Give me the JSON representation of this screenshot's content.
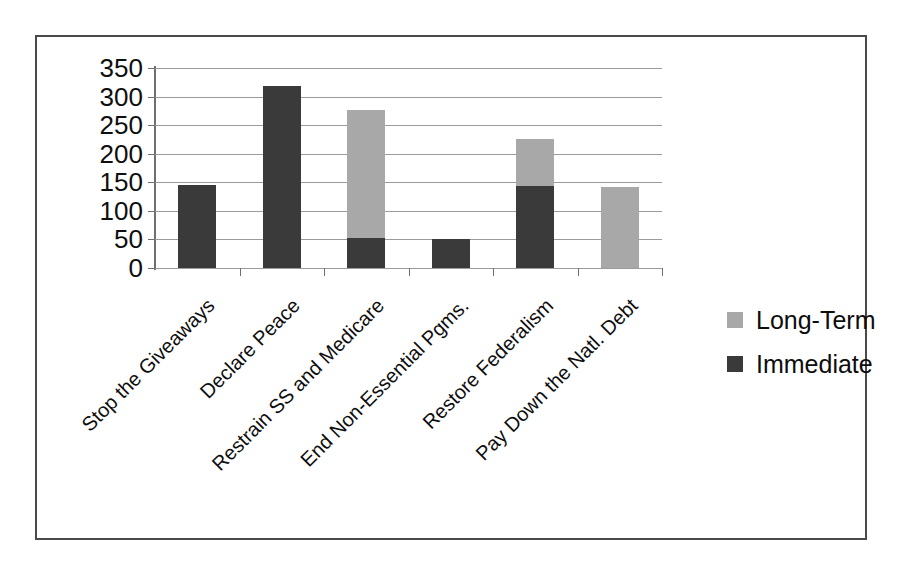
{
  "chart_data": {
    "type": "bar",
    "subtype": "stacked",
    "title": "",
    "xlabel": "",
    "ylabel": "",
    "ylim": [
      0,
      350
    ],
    "ytick_interval": 50,
    "yticks": [
      350,
      300,
      250,
      200,
      150,
      100,
      50,
      0
    ],
    "grid": true,
    "legend_position": "right",
    "categories": [
      "Stop the Giveaways",
      "Declare Peace",
      "Restrain SS and Medicare",
      "End Non-Essential Pgms.",
      "Restore Federalism",
      "Pay Down the Natl. Debt"
    ],
    "series": [
      {
        "name": "Immediate",
        "color": "#3a3a3a",
        "values": [
          145,
          318,
          52,
          50,
          143,
          0
        ]
      },
      {
        "name": "Long-Term",
        "color": "#a8a8a8",
        "values": [
          0,
          0,
          225,
          0,
          83,
          142
        ]
      }
    ],
    "totals": [
      145,
      318,
      277,
      50,
      226,
      142
    ]
  },
  "legend": {
    "items": [
      {
        "label": "Long-Term",
        "swatch": "#a8a8a8"
      },
      {
        "label": "Immediate",
        "swatch": "#3a3a3a"
      }
    ]
  }
}
